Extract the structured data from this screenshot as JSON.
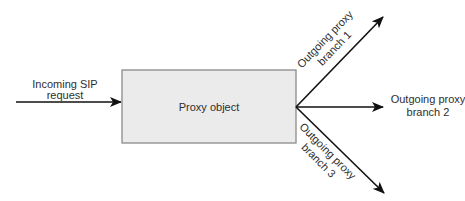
{
  "diagram": {
    "incoming": {
      "line1": "Incoming SIP",
      "line2": "request"
    },
    "proxy": {
      "label": "Proxy object",
      "fill": "#ebebeb",
      "border": "#8a8a8a"
    },
    "branches": [
      {
        "line1": "Outgoing proxy",
        "line2": "branch 1"
      },
      {
        "line1": "Outgoing proxy",
        "line2": "branch 2"
      },
      {
        "line1": "Outgoing proxy",
        "line2": "branch 3"
      }
    ],
    "arrow_color": "#111111"
  }
}
